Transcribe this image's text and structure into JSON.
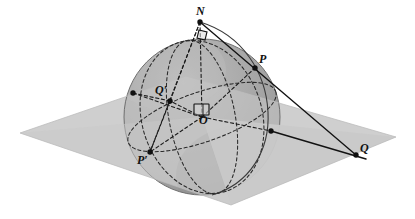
{
  "figure": {
    "kind": "geometry-diagram",
    "background_color": "#ffffff"
  },
  "colors": {
    "sphere_fill": "#a6a6a6",
    "sphere_light_band": "#b8b8b8",
    "sphere_shadow": "#9a9a9a",
    "sphere_highlight": "#bdbdbd",
    "plane_fill": "#cccccc",
    "plane_fill_front": "#c4c4c4",
    "stroke": "#1a1a1a",
    "dash_stroke": "#222222",
    "label_color": "#111111"
  },
  "labels": [
    {
      "id": "N",
      "text": "N",
      "name": "label-n",
      "x": 196,
      "y": 5,
      "meaning": "north-pole"
    },
    {
      "id": "P",
      "text": "P",
      "name": "label-p",
      "x": 259,
      "y": 53,
      "meaning": "point-on-sphere"
    },
    {
      "id": "Pp",
      "text": "P′",
      "name": "label-p-prime",
      "x": 137,
      "y": 154,
      "meaning": "antipodal-or-second-point"
    },
    {
      "id": "Qp",
      "text": "Q′",
      "name": "label-q-prime",
      "x": 155,
      "y": 84,
      "meaning": "point-on-sphere"
    },
    {
      "id": "Q",
      "text": "Q",
      "name": "label-q",
      "x": 360,
      "y": 142,
      "meaning": "projected-point-on-plane"
    },
    {
      "id": "O",
      "text": "O",
      "name": "label-o",
      "x": 199,
      "y": 114,
      "meaning": "sphere-center-origin"
    }
  ],
  "points": [
    {
      "id": "N",
      "x": 200,
      "y": 22,
      "r": 2.6,
      "name": "point-n"
    },
    {
      "id": "P",
      "x": 255,
      "y": 68,
      "r": 2.6,
      "name": "point-p"
    },
    {
      "id": "Pp",
      "x": 150,
      "y": 152,
      "r": 2.6,
      "name": "point-p-prime"
    },
    {
      "id": "Qp",
      "x": 170,
      "y": 101,
      "r": 2.6,
      "name": "point-q-prime"
    },
    {
      "id": "Q",
      "x": 356,
      "y": 155,
      "r": 2.6,
      "name": "point-q"
    },
    {
      "id": "E1",
      "x": 133,
      "y": 93,
      "r": 2.6,
      "name": "point-equator-left"
    },
    {
      "id": "E2",
      "x": 271,
      "y": 131,
      "r": 2.6,
      "name": "point-equator-right"
    }
  ],
  "sphere": {
    "cx": 202,
    "cy": 117,
    "r": 78,
    "name": "sphere"
  },
  "plane": {
    "name": "equatorial-plane",
    "vertices": [
      [
        20,
        133
      ],
      [
        186,
        76
      ],
      [
        396,
        137
      ],
      [
        231,
        205
      ]
    ]
  },
  "right_angles": [
    {
      "id": "angle-at-N",
      "x": 204,
      "y": 33,
      "size": 9,
      "name": "right-angle-marker-n"
    },
    {
      "id": "angle-at-O",
      "x": 202,
      "y": 106,
      "size": 11,
      "name": "right-angle-marker-o"
    }
  ],
  "segments": [
    {
      "id": "N-P",
      "from": "N",
      "to": "P",
      "style": "solid",
      "name": "segment-n-p"
    },
    {
      "id": "P-Q",
      "from": "P",
      "to": "Q",
      "style": "solid",
      "name": "segment-p-q"
    },
    {
      "id": "E2-Q",
      "from": "E2",
      "to": "Q",
      "style": "solid",
      "name": "segment-equator-q"
    },
    {
      "id": "N-O",
      "from": "N",
      "to": "O",
      "style": "dashed",
      "name": "segment-n-o-axis"
    },
    {
      "id": "N-Qp",
      "from": "N",
      "to": "Qp",
      "style": "dashed",
      "name": "segment-n-qprime"
    },
    {
      "id": "O-Qp",
      "from": "O",
      "to": "Qp",
      "style": "dashed",
      "name": "segment-o-qprime"
    },
    {
      "id": "O-P",
      "from": "O",
      "to": "P",
      "style": "dashed",
      "name": "segment-o-p"
    },
    {
      "id": "O-Pp",
      "from": "O",
      "to": "Pp",
      "style": "dashed",
      "name": "segment-o-pprime"
    },
    {
      "id": "Qp-Pp",
      "from": "Qp",
      "to": "Pp",
      "style": "dashed",
      "name": "segment-qprime-pprime"
    },
    {
      "id": "O-E1",
      "from": "O",
      "to": "E1",
      "style": "dashed",
      "name": "segment-o-equator-left"
    },
    {
      "id": "O-E2",
      "from": "O",
      "to": "E2",
      "style": "dashed",
      "name": "segment-o-equator-right"
    },
    {
      "id": "E1-Qp",
      "from": "E1",
      "to": "Qp",
      "style": "dashed",
      "name": "segment-equator-left-qprime"
    }
  ],
  "curves": [
    {
      "id": "equator",
      "style": "dashed",
      "name": "curve-equator"
    },
    {
      "id": "meridian-front",
      "style": "dashed",
      "name": "curve-meridian-through-p"
    },
    {
      "id": "meridian-side",
      "style": "dashed",
      "name": "curve-meridian-through-qprime"
    },
    {
      "id": "great-circle-np",
      "style": "solid",
      "name": "curve-great-circle-n-p"
    },
    {
      "id": "sphere-outline",
      "style": "solid",
      "name": "curve-sphere-outline"
    }
  ]
}
